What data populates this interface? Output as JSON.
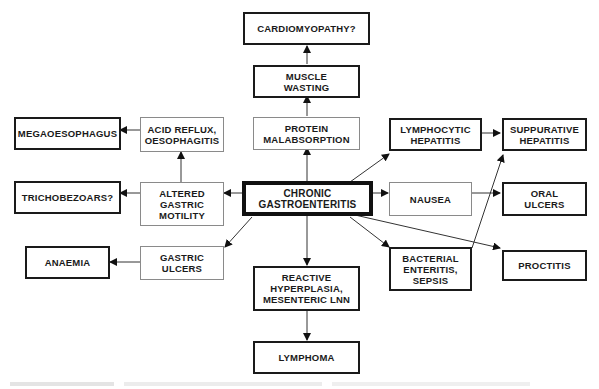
{
  "diagram": {
    "type": "flowchart",
    "central_node": "CHRONIC\nGASTROENTERITIS",
    "nodes": {
      "cardiomyopathy": "CARDIOMYOPATHY?",
      "muscle_wasting": "MUSCLE\nWASTING",
      "protein_malabsorption": "PROTEIN\nMALABSORPTION",
      "megaoesophagus": "MEGAOESOPHAGUS",
      "acid_reflux": "ACID REFLUX,\nOESOPHAGITIS",
      "trichobezoars": "TRICHOBEZOARS?",
      "altered_gastric_motility": "ALTERED\nGASTRIC\nMOTILITY",
      "chronic_gastroenteritis": "CHRONIC\nGASTROENTERITIS",
      "anaemia": "ANAEMIA",
      "gastric_ulcers": "GASTRIC\nULCERS",
      "reactive_hyperplasia": "REACTIVE\nHYPERPLASIA,\nMESENTERIC LNN",
      "lymphoma": "LYMPHOMA",
      "lymphocytic_hepatitis": "LYMPHOCYTIC\nHEPATITIS",
      "suppurative_hepatitis": "SUPPURATIVE\nHEPATITIS",
      "nausea": "NAUSEA",
      "oral_ulcers": "ORAL\nULCERS",
      "bacterial_enteritis": "BACTERIAL\nENTERITIS,\nSEPSIS",
      "proctitis": "PROCTITIS"
    },
    "edges": [
      [
        "chronic_gastroenteritis",
        "protein_malabsorption"
      ],
      [
        "protein_malabsorption",
        "muscle_wasting"
      ],
      [
        "muscle_wasting",
        "cardiomyopathy"
      ],
      [
        "chronic_gastroenteritis",
        "altered_gastric_motility"
      ],
      [
        "altered_gastric_motility",
        "acid_reflux"
      ],
      [
        "acid_reflux",
        "megaoesophagus"
      ],
      [
        "altered_gastric_motility",
        "trichobezoars"
      ],
      [
        "chronic_gastroenteritis",
        "gastric_ulcers"
      ],
      [
        "gastric_ulcers",
        "anaemia"
      ],
      [
        "chronic_gastroenteritis",
        "reactive_hyperplasia"
      ],
      [
        "reactive_hyperplasia",
        "lymphoma"
      ],
      [
        "chronic_gastroenteritis",
        "lymphocytic_hepatitis"
      ],
      [
        "lymphocytic_hepatitis",
        "suppurative_hepatitis"
      ],
      [
        "chronic_gastroenteritis",
        "nausea"
      ],
      [
        "nausea",
        "oral_ulcers"
      ],
      [
        "chronic_gastroenteritis",
        "bacterial_enteritis"
      ],
      [
        "bacterial_enteritis",
        "suppurative_hepatitis"
      ],
      [
        "chronic_gastroenteritis",
        "proctitis"
      ]
    ],
    "legend_implicit": {
      "thick_border": "outcome / clinical consequence",
      "thin_border": "intermediate mechanism"
    },
    "colors": {
      "ink": "#1a1a1a",
      "thin_border": "#8a8a8a",
      "background": "#ffffff"
    }
  }
}
